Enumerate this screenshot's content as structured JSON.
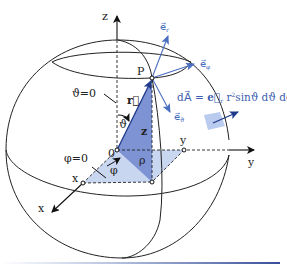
{
  "diagram": {
    "labels": {
      "z_axis": "z",
      "y_axis": "y",
      "x_axis": "x",
      "origin": "0",
      "point": "P",
      "r_vector": "r⃗",
      "theta_zero": "ϑ=0",
      "phi_zero": "φ=0",
      "theta": "ϑ",
      "phi": "φ",
      "rho": "ρ",
      "z_height": "z",
      "x_point": "x",
      "y_point": "y",
      "e_r": "e⃗",
      "e_r_sub": "r",
      "e_phi": "e⃗",
      "e_phi_sub": "φ",
      "e_theta": "e⃗",
      "e_theta_sub": "ϑ",
      "formula_lhs": "dA⃗ = ",
      "formula_e": "e⃗",
      "formula_e_sub": "r",
      "formula_rest_1": " r",
      "formula_sup": "2",
      "formula_rest_2": "sinϑ dϑ dφ"
    },
    "colors": {
      "outline": "#222222",
      "vector_blue": "#4a6ec0",
      "dark_blue": "#1f3a8a",
      "triangle_dark": "#7d93d4",
      "triangle_light": "#c9d6f0",
      "area_patch": "#b9cbee"
    }
  }
}
